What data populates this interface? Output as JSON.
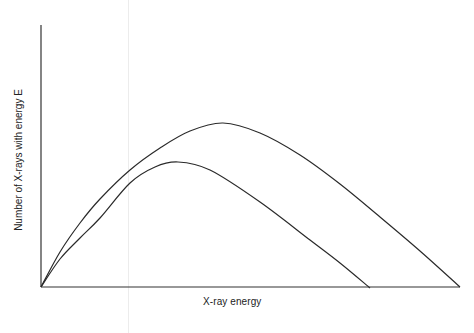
{
  "chart_data": {
    "type": "line",
    "title": "",
    "xlabel": "X-ray energy",
    "ylabel": "Number of X-rays with energy E",
    "grid": false,
    "legend": null,
    "axis_ticks": "none",
    "series": [
      {
        "name": "upper spectrum (higher tube voltage)",
        "points_px": [
          [
            41,
            287
          ],
          [
            60,
            252
          ],
          [
            80,
            223
          ],
          [
            100,
            199
          ],
          [
            130,
            170
          ],
          [
            160,
            148
          ],
          [
            190,
            131
          ],
          [
            223,
            123
          ],
          [
            260,
            133
          ],
          [
            300,
            155
          ],
          [
            340,
            184
          ],
          [
            380,
            217
          ],
          [
            420,
            251
          ],
          [
            460,
            287
          ]
        ]
      },
      {
        "name": "lower spectrum (lower tube voltage)",
        "points_px": [
          [
            41,
            287
          ],
          [
            60,
            259
          ],
          [
            80,
            238
          ],
          [
            100,
            218
          ],
          [
            130,
            183
          ],
          [
            155,
            167
          ],
          [
            178,
            162
          ],
          [
            210,
            170
          ],
          [
            260,
            202
          ],
          [
            310,
            240
          ],
          [
            340,
            263
          ],
          [
            370,
            288
          ]
        ]
      }
    ],
    "axes": {
      "origin_px": [
        41,
        287
      ],
      "x_end_px": 460,
      "y_top_px": 25
    }
  },
  "labels": {
    "x_axis": "X-ray energy",
    "y_axis": "Number of X-rays with energy E"
  }
}
